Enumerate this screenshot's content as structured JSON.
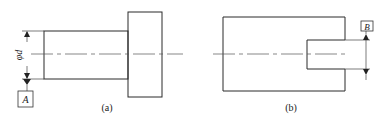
{
  "figures": [
    {
      "id": "a",
      "caption": "(a)",
      "dimension_label": "φd",
      "datum_label": "A",
      "description": "Stepped shaft: small cylinder with larger flange, diameter φd referenced to datum A"
    },
    {
      "id": "b",
      "caption": "(b)",
      "datum_label": "B",
      "description": "Block with slot, slot width referenced to datum B"
    }
  ],
  "colors": {
    "line": "#2a2a2a",
    "background": "#ffffff"
  }
}
